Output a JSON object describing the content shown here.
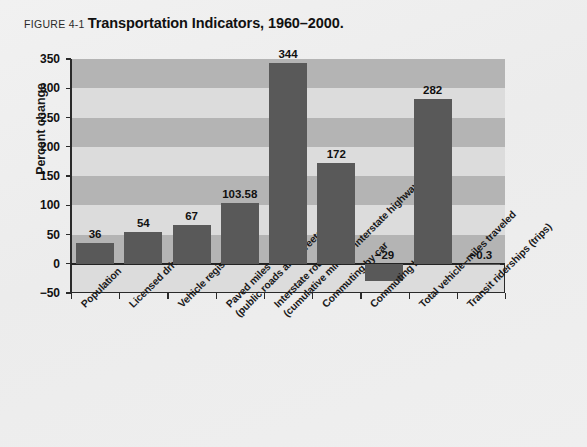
{
  "caption": {
    "figure_number": "FIGURE 4-1",
    "title": "Transportation Indicators, 1960–2000."
  },
  "colors": {
    "page_background": "#efefef",
    "bar": "#595959",
    "band_dark": "#b4b4b4",
    "band_light": "#dcdcdc",
    "axis": "#2a2a2a",
    "text": "#111111"
  },
  "chart_data": {
    "type": "bar",
    "title": "Transportation Indicators, 1960–2000.",
    "xlabel": "",
    "ylabel": "Percent change",
    "ylim": [
      -50,
      350
    ],
    "ytick_values": [
      -50,
      0,
      50,
      100,
      150,
      200,
      250,
      300,
      350
    ],
    "ytick_labels": [
      "−50",
      "0",
      "50",
      "100",
      "150",
      "200",
      "250",
      "300",
      "350"
    ],
    "grid": "alternating horizontal bands",
    "legend": "none",
    "categories": [
      "Population",
      "Licensed drivers",
      "Vehicle registrations",
      "Paved miles of road (public roads and streets)",
      "Interstate route miles (cumulative miles of interstate highway)",
      "Commuting by car",
      "Commuting by transit",
      "Total vehicle–miles traveled",
      "Transit riderships (trips)"
    ],
    "category_lines": [
      [
        "Population",
        ""
      ],
      [
        "Licensed drivers",
        ""
      ],
      [
        "Vehicle registrations",
        ""
      ],
      [
        "Paved miles of road",
        "(public roads and streets)"
      ],
      [
        "Interstate route miles",
        "(cumulative miles of interstate highway)"
      ],
      [
        "Commuting by car",
        ""
      ],
      [
        "Commuting by transit",
        ""
      ],
      [
        "Total vehicle–miles traveled",
        ""
      ],
      [
        "Transit riderships (trips)",
        ""
      ]
    ],
    "values": [
      36,
      54,
      67,
      103.58,
      344,
      172,
      -29,
      282,
      -0.3
    ],
    "value_labels": [
      "36",
      "54",
      "67",
      "103.58",
      "344",
      "172",
      "−29",
      "282",
      "−0.3"
    ]
  }
}
